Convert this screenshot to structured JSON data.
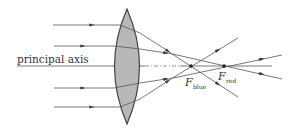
{
  "diagram": {
    "type": "ray-optics",
    "principal_axis_label": "principal axis",
    "focal_points": [
      {
        "id": "blue",
        "symbol": "F",
        "subscript": "blue",
        "x": 191,
        "y": 66
      },
      {
        "id": "red",
        "symbol": "F",
        "subscript": "red",
        "x": 224,
        "y": 66
      }
    ],
    "lens": {
      "type": "biconvex",
      "center_x": 127,
      "top_y": 9,
      "bottom_y": 124,
      "half_width": 17,
      "fill": "#b8b8b8",
      "stroke": "#444444"
    },
    "incoming_rays_y": [
      25,
      46,
      88,
      107
    ],
    "colors": {
      "line": "#555555",
      "background": "#ffffff"
    }
  }
}
